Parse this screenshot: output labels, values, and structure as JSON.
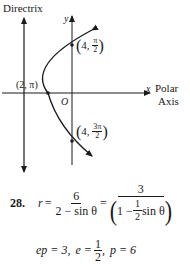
{
  "figure": {
    "directrix_label": "Directrix",
    "y_axis_label": "y",
    "x_axis_label": "x",
    "polar_axis_label_1": "Polar",
    "polar_axis_label_2": "Axis",
    "origin_label": "O",
    "vertex_label": "(2, π)",
    "point_top": {
      "r": "4",
      "theta_num": "π",
      "theta_den": "2"
    },
    "point_bottom": {
      "r": "4",
      "theta_num": "3π",
      "theta_den": "2"
    },
    "colors": {
      "ink": "#1a1a1a",
      "background": "#ffffff"
    }
  },
  "solution": {
    "problem_number": "28.",
    "lhs": "r",
    "equals": "=",
    "frac1": {
      "num": "6",
      "den": "2 − sin θ"
    },
    "frac2": {
      "num": "3",
      "den_left": "1 −",
      "den_inner_num": "1",
      "den_inner_den": "2",
      "den_right": "sin θ"
    },
    "line2": {
      "ep": "ep = 3,",
      "e_lhs": "e =",
      "e_num": "1",
      "e_den": "2",
      "e_sep": ",",
      "p": "p = 6"
    }
  }
}
